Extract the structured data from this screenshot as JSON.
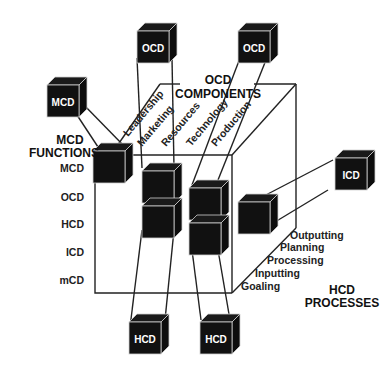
{
  "diagram": {
    "axes": {
      "functions": {
        "title_line1": "MCD",
        "title_line2": "FUNCTIONS",
        "items": [
          "MCD",
          "OCD",
          "HCD",
          "ICD",
          "mCD"
        ]
      },
      "components": {
        "title_line1": "OCD",
        "title_line2": "COMPONENTS",
        "items": [
          "Leadership",
          "Marketing",
          "Resources",
          "Technology",
          "Production"
        ]
      },
      "processes": {
        "title_line1": "HCD",
        "title_line2": "PROCESSES",
        "items": [
          "Outputting",
          "Planning",
          "Processing",
          "Inputting",
          "Goaling"
        ]
      }
    },
    "external_cubes": {
      "mcd": "MCD",
      "ocd_left": "OCD",
      "ocd_right": "OCD",
      "icd": "ICD",
      "hcd_left": "HCD",
      "hcd_right": "HCD"
    },
    "colors": {
      "cube_fill": "#111111",
      "line": "#222222",
      "background": "#ffffff"
    }
  }
}
